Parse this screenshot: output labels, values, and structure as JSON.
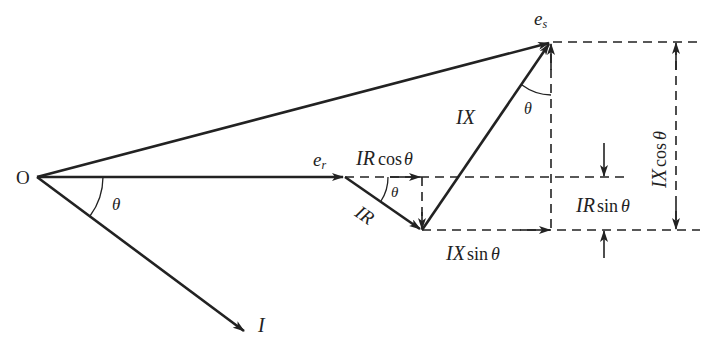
{
  "diagram": {
    "type": "phasor-diagram",
    "labels": {
      "origin": "O",
      "receiving_voltage": "e",
      "receiving_sub": "r",
      "sending_voltage": "e",
      "sending_sub": "s",
      "current": "I",
      "angle_origin": "θ",
      "angle_ir": "θ",
      "angle_ix": "θ",
      "ir_drop": "IR",
      "ix_drop": "IX",
      "ir_cos_main": "IR",
      "ir_cos_fn": "cos",
      "ir_cos_theta": "θ",
      "ir_sin_main": "IR",
      "ir_sin_fn": "sin",
      "ir_sin_theta": "θ",
      "ix_sin_main": "IX",
      "ix_sin_fn": "sin",
      "ix_sin_theta": "θ",
      "ix_cos_main": "IX",
      "ix_cos_fn": "cos",
      "ix_cos_theta": "θ"
    },
    "colors": {
      "line": "#222222",
      "background": "#ffffff"
    }
  }
}
